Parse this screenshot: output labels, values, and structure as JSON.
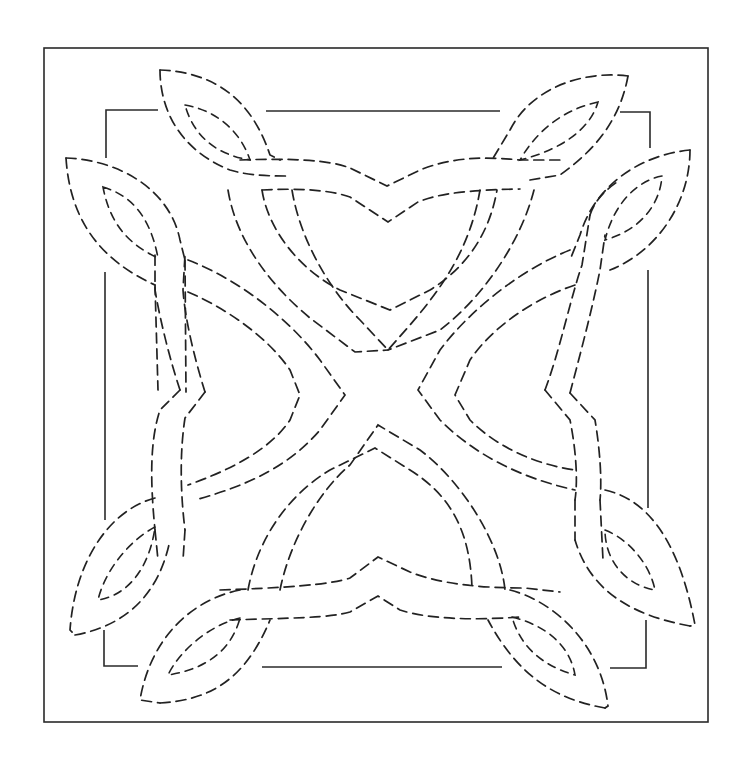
{
  "diagram": {
    "type": "quilting-pattern",
    "stroke_color": "#222222",
    "background": "#ffffff",
    "outer_frame": {
      "x": 44,
      "y": 48,
      "width": 664,
      "height": 674
    },
    "inner_frame": {
      "x": 106,
      "y": 110,
      "width": 544,
      "height": 558
    },
    "motifs": {
      "hearts": [
        "top",
        "right",
        "bottom",
        "left"
      ],
      "leaves": [
        "top-left-upper",
        "top-left-lower",
        "top-right-upper",
        "top-right-lower",
        "bottom-left-upper",
        "bottom-left-lower",
        "bottom-right-upper",
        "bottom-right-lower"
      ]
    }
  }
}
